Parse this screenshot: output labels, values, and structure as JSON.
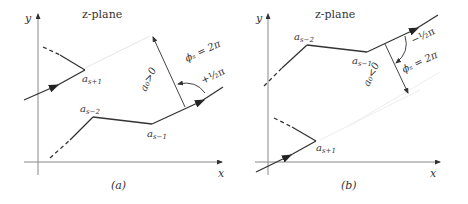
{
  "panel_a": {
    "title": "z-plane",
    "caption": "(a)",
    "axis_x": "x",
    "axis_y": "y",
    "labels": {
      "a_s_plus_1": "a",
      "a_s_plus_1_sub": "s+1",
      "a_s_minus_2": "a",
      "a_s_minus_2_sub": "s−2",
      "a_s_minus_1": "a",
      "a_s_minus_1_sub": "s−1",
      "a0_cond": "a₀>0",
      "phi": "ϕₛ = 2π",
      "angle": "+½π"
    }
  },
  "panel_b": {
    "title": "z-plane",
    "caption": "(b)",
    "axis_x": "x",
    "axis_y": "y",
    "labels": {
      "a_s_plus_1": "a",
      "a_s_plus_1_sub": "s+1",
      "a_s_minus_2": "a",
      "a_s_minus_2_sub": "s−2",
      "a_s_minus_1": "a",
      "a_s_minus_1_sub": "s−1",
      "a0_cond": "a₀<0",
      "phi": "ϕₛ = 2π",
      "angle": "−½π"
    }
  }
}
